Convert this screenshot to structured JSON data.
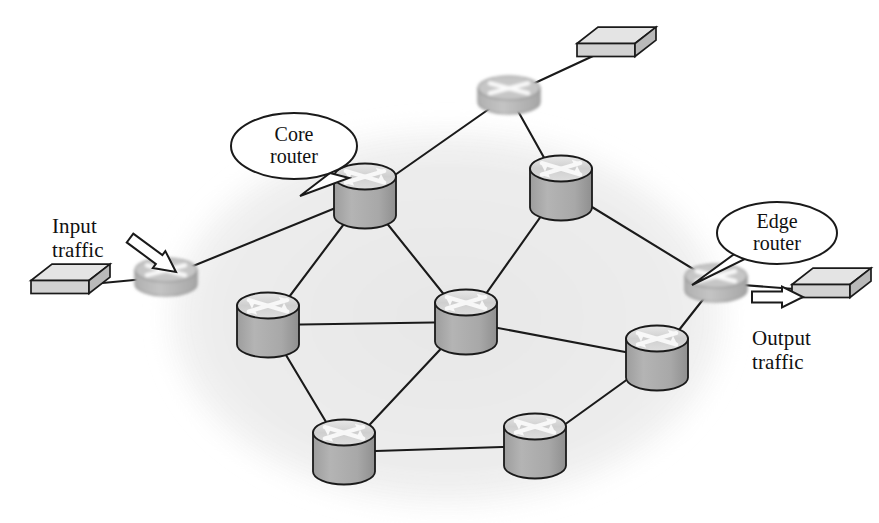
{
  "figure": {
    "kind": "network-topology-diagram",
    "background_color": "#ffffff",
    "cloud_color": "#ededed",
    "line_color": "#1a1a1a",
    "router_body_color": "#a8a8a8",
    "router_top_color": "#d8d8d8",
    "edge_router_color": "#b5b5b5",
    "box_top_color": "#e2e2e2",
    "box_face_color": "#cfcfcf"
  },
  "labels": {
    "input_traffic": "Input\ntraffic",
    "output_traffic": "Output\ntraffic"
  },
  "callouts": [
    {
      "id": "core-router-callout",
      "text": "Core\nrouter",
      "cx": 294,
      "cy": 146,
      "rx": 63,
      "ry": 33,
      "tail": [
        [
          330,
          173
        ],
        [
          300,
          196
        ],
        [
          349,
          178
        ]
      ]
    },
    {
      "id": "edge-router-callout",
      "text": "Edge\nrouter",
      "cx": 777,
      "cy": 233,
      "rx": 60,
      "ry": 31,
      "tail": [
        [
          737,
          252
        ],
        [
          692,
          285
        ],
        [
          747,
          258
        ]
      ]
    }
  ],
  "nodes": [
    {
      "id": "edge-router-left",
      "type": "edge-router",
      "label": "edge router",
      "cx": 166,
      "cy": 277,
      "rx": 31,
      "ry": 12,
      "h": 14
    },
    {
      "id": "edge-router-top",
      "type": "edge-router",
      "label": "edge router",
      "cx": 509,
      "cy": 95,
      "rx": 31,
      "ry": 12,
      "h": 14
    },
    {
      "id": "edge-router-right",
      "type": "edge-router",
      "label": "edge router",
      "cx": 716,
      "cy": 283,
      "rx": 31,
      "ry": 12,
      "h": 14
    },
    {
      "id": "core-router-1",
      "type": "core-router",
      "label": "core router",
      "cx": 365,
      "cy": 196,
      "rx": 31,
      "ry": 13,
      "h": 39
    },
    {
      "id": "core-router-2",
      "type": "core-router",
      "label": "core router",
      "cx": 561,
      "cy": 188,
      "rx": 31,
      "ry": 13,
      "h": 39
    },
    {
      "id": "core-router-3",
      "type": "core-router",
      "label": "core router",
      "cx": 268,
      "cy": 325,
      "rx": 31,
      "ry": 13,
      "h": 39
    },
    {
      "id": "core-router-4",
      "type": "core-router",
      "label": "core router",
      "cx": 466,
      "cy": 322,
      "rx": 31,
      "ry": 13,
      "h": 39
    },
    {
      "id": "core-router-5",
      "type": "core-router",
      "label": "core router",
      "cx": 657,
      "cy": 358,
      "rx": 31,
      "ry": 13,
      "h": 39
    },
    {
      "id": "core-router-6",
      "type": "core-router",
      "label": "core router",
      "cx": 344,
      "cy": 452,
      "rx": 31,
      "ry": 13,
      "h": 39
    },
    {
      "id": "core-router-7",
      "type": "core-router",
      "label": "core router",
      "cx": 535,
      "cy": 446,
      "rx": 31,
      "ry": 13,
      "h": 39
    },
    {
      "id": "host-box-left",
      "type": "host-box",
      "label": "host device",
      "cx": 60,
      "cy": 287
    },
    {
      "id": "host-box-top",
      "type": "host-box",
      "label": "host device",
      "cx": 606,
      "cy": 50
    },
    {
      "id": "host-box-right",
      "type": "host-box",
      "label": "host device",
      "cx": 821,
      "cy": 291
    }
  ],
  "links": [
    {
      "from": "host-box-left",
      "to": "edge-router-left"
    },
    {
      "from": "edge-router-left",
      "to": "core-router-1"
    },
    {
      "from": "host-box-top",
      "to": "edge-router-top"
    },
    {
      "from": "edge-router-top",
      "to": "core-router-1"
    },
    {
      "from": "edge-router-top",
      "to": "core-router-2"
    },
    {
      "from": "core-router-1",
      "to": "core-router-3"
    },
    {
      "from": "core-router-1",
      "to": "core-router-4"
    },
    {
      "from": "core-router-2",
      "to": "core-router-4"
    },
    {
      "from": "core-router-2",
      "to": "edge-router-right"
    },
    {
      "from": "core-router-3",
      "to": "core-router-4"
    },
    {
      "from": "core-router-3",
      "to": "core-router-6"
    },
    {
      "from": "core-router-4",
      "to": "core-router-5"
    },
    {
      "from": "core-router-4",
      "to": "core-router-6"
    },
    {
      "from": "core-router-5",
      "to": "edge-router-right"
    },
    {
      "from": "core-router-5",
      "to": "core-router-7"
    },
    {
      "from": "core-router-6",
      "to": "core-router-7"
    },
    {
      "from": "edge-router-right",
      "to": "host-box-right"
    }
  ],
  "arrows": [
    {
      "id": "input-traffic-arrow",
      "label": "input traffic arrow",
      "x1": 130,
      "y1": 238,
      "x2": 176,
      "y2": 272
    },
    {
      "id": "output-traffic-arrow",
      "label": "output traffic arrow",
      "x1": 752,
      "y1": 297,
      "x2": 803,
      "y2": 297
    }
  ],
  "text_positions": {
    "input_traffic": {
      "x": 52,
      "y": 215
    },
    "output_traffic": {
      "x": 752,
      "y": 327
    }
  }
}
